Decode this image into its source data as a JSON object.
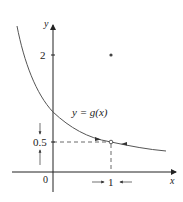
{
  "figure": {
    "function_label": "y = g(x)",
    "axes": {
      "x_label": "x",
      "y_label": "y",
      "origin_label": "0",
      "x_ticks": [
        {
          "value": 1,
          "label": "1"
        }
      ],
      "y_ticks": [
        {
          "value": 2,
          "label": "2"
        },
        {
          "value": 0.5,
          "label": "0.5"
        }
      ]
    },
    "points": {
      "open_circle": {
        "x": 1,
        "y": 0.5,
        "description": "hole in curve at x=1"
      },
      "filled_dot": {
        "x": 1,
        "y": 2,
        "description": "g(1) = 2"
      }
    },
    "annotations": {
      "x_approach": "arrows pointing toward x = 1 from both sides",
      "y_approach": "arrows pointing toward y = 0.5 from above and below",
      "curve_arrows": "arrows on curve approaching the hole from left and right"
    },
    "colors": {
      "curve": "#555555",
      "axes": "#222222",
      "dashed": "#444444"
    }
  }
}
